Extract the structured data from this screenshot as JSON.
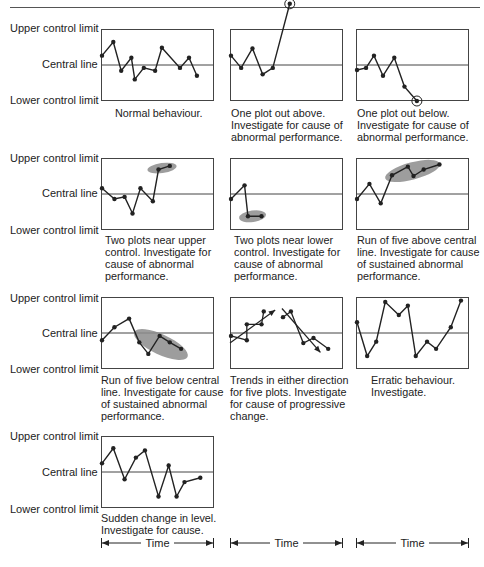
{
  "labels": {
    "upper": "Upper control limit",
    "central": "Central line",
    "lower": "Lower control limit",
    "time": "Time"
  },
  "colors": {
    "line": "#222222",
    "frame": "#444444",
    "highlight": "#8c8c8c"
  },
  "chart_data": [
    {
      "type": "line",
      "title": "Normal behaviour.",
      "caption": [
        "Normal behaviour."
      ],
      "points": [
        [
          0,
          0.37
        ],
        [
          0.1,
          0.18
        ],
        [
          0.17,
          0.58
        ],
        [
          0.26,
          0.4
        ],
        [
          0.29,
          0.7
        ],
        [
          0.37,
          0.54
        ],
        [
          0.47,
          0.58
        ],
        [
          0.53,
          0.26
        ],
        [
          0.69,
          0.54
        ],
        [
          0.77,
          0.4
        ],
        [
          0.84,
          0.65
        ]
      ],
      "circled": [],
      "ellipse": null,
      "arrows": []
    },
    {
      "type": "line",
      "title": "One plot out above.",
      "caption": [
        "One plot out above.",
        "Investigate for cause of",
        "abnormal performance."
      ],
      "points": [
        [
          0,
          0.37
        ],
        [
          0.09,
          0.54
        ],
        [
          0.19,
          0.27
        ],
        [
          0.28,
          0.63
        ],
        [
          0.37,
          0.54
        ],
        [
          0.52,
          -0.35
        ]
      ],
      "circled": [
        5
      ],
      "ellipse": null,
      "arrows": []
    },
    {
      "type": "line",
      "title": "One plot out below.",
      "caption": [
        "One plot out below.",
        "Investigate for cause of",
        "abnormal performance."
      ],
      "points": [
        [
          0,
          0.57
        ],
        [
          0.08,
          0.54
        ],
        [
          0.15,
          0.37
        ],
        [
          0.23,
          0.65
        ],
        [
          0.33,
          0.4
        ],
        [
          0.42,
          0.8
        ],
        [
          0.53,
          1.0
        ]
      ],
      "circled": [
        6
      ],
      "ellipse": null,
      "arrows": []
    },
    {
      "type": "line",
      "title": "Two plots near upper control.",
      "caption": [
        "Two plots near upper",
        "control. Investigate for",
        "cause of abnormal",
        "performance."
      ],
      "points": [
        [
          0,
          0.42
        ],
        [
          0.11,
          0.57
        ],
        [
          0.2,
          0.54
        ],
        [
          0.27,
          0.77
        ],
        [
          0.34,
          0.42
        ],
        [
          0.45,
          0.6
        ],
        [
          0.5,
          0.16
        ],
        [
          0.6,
          0.11
        ]
      ],
      "circled": [],
      "ellipse": {
        "cx": 0.54,
        "cy": 0.14,
        "rx": 0.13,
        "ry": 0.07
      },
      "arrows": []
    },
    {
      "type": "line",
      "title": "Two plots near lower control.",
      "caption": [
        "Two plots near lower",
        "control. Investigate for",
        "cause of abnormal",
        "performance."
      ],
      "points": [
        [
          0,
          0.57
        ],
        [
          0.12,
          0.38
        ],
        [
          0.15,
          0.81
        ],
        [
          0.27,
          0.81
        ]
      ],
      "circled": [],
      "ellipse": {
        "cx": 0.2,
        "cy": 0.81,
        "rx": 0.12,
        "ry": 0.08
      },
      "arrows": []
    },
    {
      "type": "line",
      "title": "Run of five above central line.",
      "caption": [
        "Run of five above central",
        "line. Investigate for cause",
        "of sustained abnormal",
        "performance."
      ],
      "points": [
        [
          0,
          0.57
        ],
        [
          0.11,
          0.36
        ],
        [
          0.21,
          0.63
        ],
        [
          0.31,
          0.24
        ],
        [
          0.45,
          0.12
        ],
        [
          0.5,
          0.25
        ],
        [
          0.59,
          0.16
        ],
        [
          0.73,
          0.09
        ]
      ],
      "circled": [],
      "ellipse": {
        "cx": 0.5,
        "cy": 0.18,
        "rx": 0.25,
        "ry": 0.12
      },
      "arrows": []
    },
    {
      "type": "line",
      "title": "Run of five below central line.",
      "caption": [
        "Run of five below central",
        "line. Investigate for cause",
        "of sustained abnormal",
        "performance."
      ],
      "points": [
        [
          0,
          0.6
        ],
        [
          0.11,
          0.42
        ],
        [
          0.24,
          0.3
        ],
        [
          0.33,
          0.63
        ],
        [
          0.41,
          0.79
        ],
        [
          0.51,
          0.54
        ],
        [
          0.6,
          0.63
        ],
        [
          0.7,
          0.72
        ]
      ],
      "circled": [],
      "ellipse": {
        "cx": 0.53,
        "cy": 0.66,
        "rx": 0.26,
        "ry": 0.14
      },
      "arrows": []
    },
    {
      "type": "line",
      "title": "Trends in either direction for five plots.",
      "caption": [
        "Trends in either direction",
        "for five plots. Investigate",
        "for cause of progressive",
        "change."
      ],
      "points": [
        [
          0,
          0.54
        ],
        [
          0.14,
          0.6
        ],
        [
          0.14,
          0.38
        ],
        [
          0.27,
          0.38
        ],
        [
          0.29,
          0.2
        ],
        [
          0.46,
          0.28
        ],
        [
          0.53,
          0.2
        ],
        [
          0.64,
          0.64
        ],
        [
          0.73,
          0.57
        ],
        [
          0.86,
          0.72
        ]
      ],
      "circled": [],
      "ellipse": null,
      "arrows": [
        [
          0,
          0.64,
          0.4,
          0.18
        ],
        [
          0.46,
          0.16,
          0.8,
          0.77
        ]
      ]
    },
    {
      "type": "line",
      "title": "Erratic behaviour.",
      "caption": [
        "Erratic behaviour.",
        "Investigate."
      ],
      "points": [
        [
          0,
          0.35
        ],
        [
          0.09,
          0.82
        ],
        [
          0.17,
          0.62
        ],
        [
          0.25,
          0.07
        ],
        [
          0.37,
          0.25
        ],
        [
          0.45,
          0.12
        ],
        [
          0.52,
          0.82
        ],
        [
          0.62,
          0.62
        ],
        [
          0.7,
          0.72
        ],
        [
          0.83,
          0.42
        ],
        [
          0.92,
          0.05
        ]
      ],
      "circled": [],
      "ellipse": null,
      "arrows": []
    },
    {
      "type": "line",
      "title": "Sudden change in level.",
      "caption": [
        "Sudden change in level.",
        "Investigate for cause."
      ],
      "points": [
        [
          0,
          0.38
        ],
        [
          0.1,
          0.17
        ],
        [
          0.2,
          0.6
        ],
        [
          0.3,
          0.3
        ],
        [
          0.38,
          0.2
        ],
        [
          0.5,
          0.84
        ],
        [
          0.59,
          0.41
        ],
        [
          0.66,
          0.84
        ],
        [
          0.73,
          0.64
        ],
        [
          0.87,
          0.58
        ]
      ],
      "circled": [],
      "ellipse": null,
      "arrows": []
    }
  ]
}
